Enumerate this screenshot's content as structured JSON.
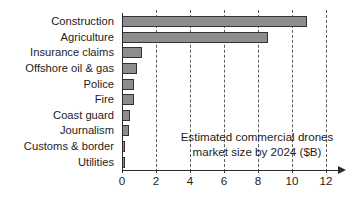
{
  "chart_data": {
    "type": "bar",
    "orientation": "horizontal",
    "title": "",
    "xlabel": "",
    "ylabel": "",
    "xlim": [
      0,
      12
    ],
    "xticks": [
      0,
      2,
      4,
      6,
      8,
      10,
      12
    ],
    "grid": true,
    "legend": null,
    "annotation_lines": [
      "Estimated commercial drones",
      "market size by 2024 ($B)"
    ],
    "units": "$B",
    "categories": [
      "Construction",
      "Agriculture",
      "Insurance claims",
      "Offshore oil & gas",
      "Police",
      "Fire",
      "Coast guard",
      "Journalism",
      "Customs & border",
      "Utilities"
    ],
    "values": [
      10.9,
      8.6,
      1.2,
      0.9,
      0.7,
      0.7,
      0.45,
      0.4,
      0.2,
      0.15
    ],
    "colors": {
      "bar_fill": "#8d8d8d",
      "bar_border": "#333333",
      "gridline": "#5d5d5d",
      "axis": "#2b2b2b",
      "text": "#1d1d1d",
      "background": "#ffffff"
    }
  }
}
